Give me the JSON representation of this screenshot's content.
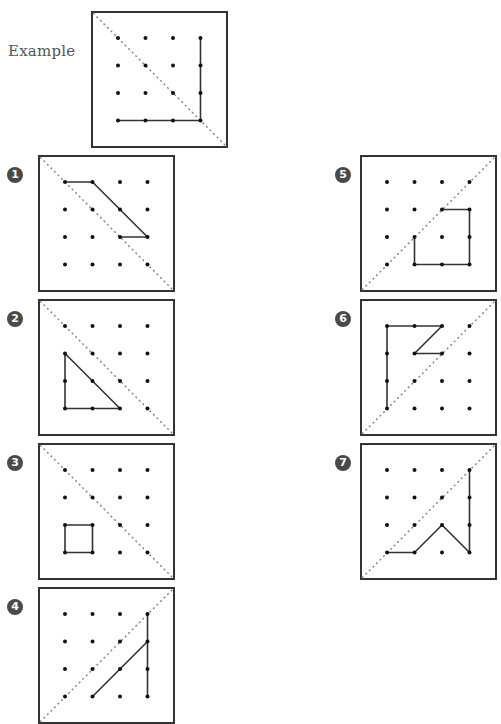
{
  "example": {
    "label": "Example",
    "box": {
      "x": 91,
      "y": 11
    },
    "diagonal": "tl-br",
    "paths": [
      [
        [
          3,
          0
        ],
        [
          3,
          3
        ],
        [
          0,
          3
        ]
      ]
    ]
  },
  "problems": [
    {
      "number": "1",
      "box": {
        "x": 38,
        "y": 155
      },
      "badge": {
        "x": 7,
        "y": 167
      },
      "diagonal": "tl-br",
      "paths": [
        [
          [
            0,
            0
          ],
          [
            1,
            0
          ],
          [
            3,
            2
          ],
          [
            2,
            2
          ]
        ]
      ]
    },
    {
      "number": "2",
      "box": {
        "x": 38,
        "y": 299
      },
      "badge": {
        "x": 7,
        "y": 311
      },
      "diagonal": "tl-br",
      "paths": [
        [
          [
            0,
            1
          ],
          [
            0,
            3
          ],
          [
            2,
            3
          ],
          [
            0,
            1
          ]
        ]
      ]
    },
    {
      "number": "3",
      "box": {
        "x": 38,
        "y": 443
      },
      "badge": {
        "x": 7,
        "y": 455
      },
      "diagonal": "tl-br",
      "paths": [
        [
          [
            0,
            2
          ],
          [
            1,
            2
          ],
          [
            1,
            3
          ],
          [
            0,
            3
          ],
          [
            0,
            2
          ]
        ]
      ]
    },
    {
      "number": "4",
      "box": {
        "x": 38,
        "y": 587
      },
      "badge": {
        "x": 7,
        "y": 599
      },
      "diagonal": "bl-tr",
      "paths": [
        [
          [
            3,
            0
          ],
          [
            3,
            3
          ]
        ],
        [
          [
            3,
            1
          ],
          [
            1,
            3
          ]
        ]
      ]
    },
    {
      "number": "5",
      "box": {
        "x": 360,
        "y": 155
      },
      "badge": {
        "x": 335,
        "y": 167
      },
      "diagonal": "bl-tr",
      "paths": [
        [
          [
            2,
            1
          ],
          [
            3,
            1
          ],
          [
            3,
            3
          ],
          [
            1,
            3
          ],
          [
            1,
            2
          ]
        ]
      ]
    },
    {
      "number": "6",
      "box": {
        "x": 360,
        "y": 299
      },
      "badge": {
        "x": 335,
        "y": 311
      },
      "diagonal": "bl-tr",
      "paths": [
        [
          [
            0,
            3
          ],
          [
            0,
            0
          ],
          [
            2,
            0
          ],
          [
            1,
            1
          ],
          [
            2,
            1
          ]
        ]
      ]
    },
    {
      "number": "7",
      "box": {
        "x": 360,
        "y": 443
      },
      "badge": {
        "x": 335,
        "y": 455
      },
      "diagonal": "bl-tr",
      "paths": [
        [
          [
            0,
            3
          ],
          [
            1,
            3
          ],
          [
            2,
            2
          ],
          [
            3,
            3
          ],
          [
            3,
            0
          ]
        ]
      ]
    }
  ],
  "grid": {
    "rows": 4,
    "cols": 4,
    "offset": 27,
    "spacing": 27.5,
    "size": 137
  },
  "colors": {
    "line": "#333333",
    "dot": "#111111",
    "diagonal": "#888888",
    "badge": "#4a4a4a"
  }
}
